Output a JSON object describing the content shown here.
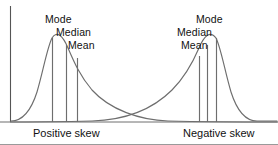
{
  "figure": {
    "width": 278,
    "height": 145,
    "background": "#ffffff",
    "line_color": "#6e6e6e",
    "axis_color": "#555555",
    "text_color": "#111111",
    "border_bottom_color": "#9a9a9a"
  },
  "annotations": {
    "left": {
      "mode": "Mode",
      "median": "Median",
      "mean": "Mean"
    },
    "right": {
      "mode": "Mode",
      "median": "Median",
      "mean": "Mean"
    }
  },
  "captions": {
    "left": "Positive skew",
    "right": "Negative skew"
  },
  "chart_data": {
    "type": "line",
    "title": "",
    "subtitle": "",
    "xlabel": "",
    "ylabel": "",
    "grid": false,
    "legend": "none",
    "axes": {
      "y_axis_shown": true,
      "x_axis_shown": true,
      "y_axis_x_px": 10,
      "baseline_y_px": 122,
      "y_axis_top_px": 6,
      "tick_labels_x": [],
      "tick_labels_y": []
    },
    "series": [
      {
        "name": "Positive skew",
        "description": "Right-skewed unimodal density curve; long tail toward the right",
        "peak_x_px": 52,
        "peak_y_px": 38,
        "path": "M 11,121 C 20,121 30,114 37,92 C 43,72 47,48 52,38 C 57,30 63,36 68,48 C 74,62 80,76 92,90 C 110,110 140,120 168,121 C 210,122 250,122 277,122",
        "markers": [
          {
            "label": "Mode",
            "x_px": 52,
            "top_y_px": 38,
            "bottom_y_px": 122
          },
          {
            "label": "Median",
            "x_px": 66,
            "top_y_px": 45,
            "bottom_y_px": 122
          },
          {
            "label": "Mean",
            "x_px": 77,
            "top_y_px": 58,
            "bottom_y_px": 122
          }
        ]
      },
      {
        "name": "Negative skew",
        "description": "Left-skewed unimodal density curve; long tail toward the left",
        "peak_x_px": 216,
        "peak_y_px": 38,
        "path": "M 0,122 C 22,122 52,122 92,121 C 124,120 152,110 172,90 C 186,76 193,62 199,48 C 204,36 210,30 216,38 C 221,48 225,72 231,92 C 238,114 248,121 257,121 C 266,121 272,121 277,121",
        "markers": [
          {
            "label": "Mean",
            "x_px": 199,
            "top_y_px": 56,
            "bottom_y_px": 122
          },
          {
            "label": "Median",
            "x_px": 207,
            "top_y_px": 45,
            "bottom_y_px": 122
          },
          {
            "label": "Mode",
            "x_px": 216,
            "top_y_px": 38,
            "bottom_y_px": 122
          }
        ]
      }
    ]
  }
}
